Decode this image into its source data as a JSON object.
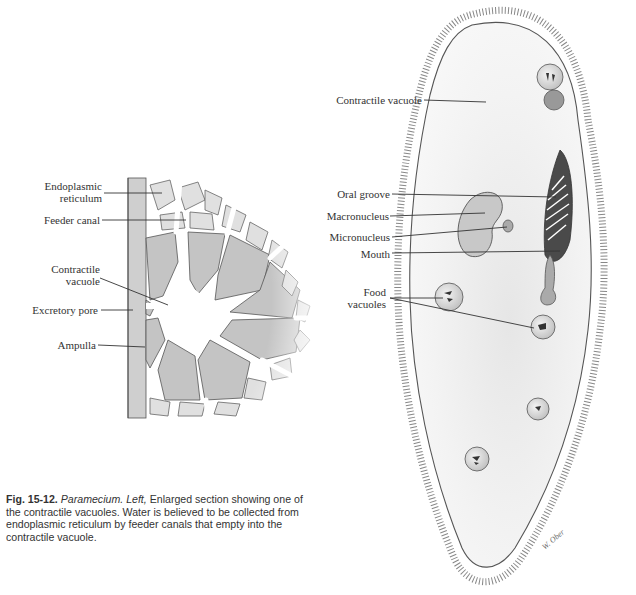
{
  "figure": {
    "number": "Fig. 15-12.",
    "subject": "Paramecium.",
    "qualifier": "Left,",
    "caption_text": "Enlarged section showing one of the contractile vacuoles. Water is believed to be collected from endoplasmic reticulum by feeder canals that empty into the contractile vacuole.",
    "signature": "W. Ober"
  },
  "left_diagram": {
    "labels": {
      "endoplasmic_1": "Endoplasmic",
      "endoplasmic_2": "reticulum",
      "feeder_canal": "Feeder canal",
      "contractile_1": "Contractile",
      "contractile_2": "vacuole",
      "excretory_pore": "Excretory pore",
      "ampulla": "Ampulla"
    }
  },
  "right_diagram": {
    "labels": {
      "contractile_vacuole": "Contractile vacuole",
      "oral_groove": "Oral groove",
      "macronucleus": "Macronucleus",
      "micronucleus": "Micronucleus",
      "mouth": "Mouth",
      "food_1": "Food",
      "food_2": "vacuoles"
    }
  },
  "colors": {
    "ink": "#333333",
    "shade": "#bdbdbd",
    "light_shade": "#e2e2e2",
    "background": "#ffffff"
  }
}
